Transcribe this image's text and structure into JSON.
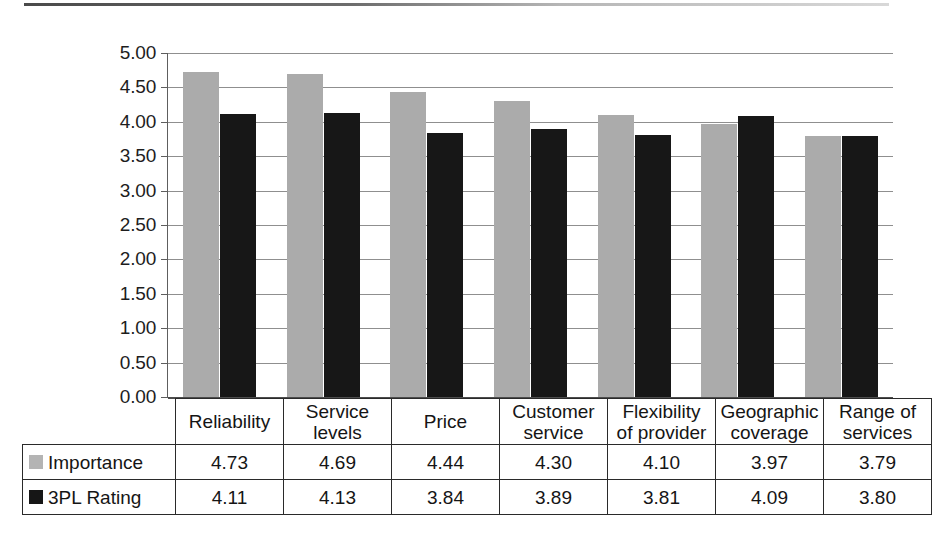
{
  "chart_data": {
    "type": "bar",
    "title": "",
    "subtitle": "",
    "xlabel": "",
    "ylabel": "",
    "ylim": [
      0,
      5
    ],
    "ytick_step": 0.5,
    "ytick_labels": [
      "5.00",
      "4.50",
      "4.00",
      "3.50",
      "3.00",
      "2.50",
      "2.00",
      "1.50",
      "1.00",
      "0.50",
      "0.00"
    ],
    "ytick_values": [
      5.0,
      4.5,
      4.0,
      3.5,
      3.0,
      2.5,
      2.0,
      1.5,
      1.0,
      0.5,
      0.0
    ],
    "grid": true,
    "legend_position": "table-left",
    "categories": [
      "Reliability",
      "Service levels",
      "Price",
      "Customer service",
      "Flexibility of provider",
      "Geographic coverage",
      "Range of services"
    ],
    "category_lines": [
      [
        "Reliability"
      ],
      [
        "Service",
        "levels"
      ],
      [
        "Price"
      ],
      [
        "Customer",
        "service"
      ],
      [
        "Flexibility",
        "of provider"
      ],
      [
        "Geographic",
        "coverage"
      ],
      [
        "Range of",
        "services"
      ]
    ],
    "series": [
      {
        "name": "Importance",
        "color": "#ababab",
        "values": [
          4.73,
          4.69,
          4.44,
          4.3,
          4.1,
          3.97,
          3.79
        ],
        "labels": [
          "4.73",
          "4.69",
          "4.44",
          "4.30",
          "4.10",
          "3.97",
          "3.79"
        ]
      },
      {
        "name": "3PL Rating",
        "color": "#171717",
        "values": [
          4.11,
          4.13,
          3.84,
          3.89,
          3.81,
          4.09,
          3.8
        ],
        "labels": [
          "4.11",
          "4.13",
          "3.84",
          "3.89",
          "3.81",
          "4.09",
          "3.80"
        ]
      }
    ]
  },
  "table": {
    "corner_label": "",
    "column_headers": [
      "Reliability",
      "Service levels",
      "Price",
      "Customer service",
      "Flexibility of provider",
      "Geographic coverage",
      "Range of services"
    ],
    "rows": [
      {
        "label": "Importance",
        "swatch_color": "#b4b4b4",
        "values": [
          "4.73",
          "4.69",
          "4.44",
          "4.30",
          "4.10",
          "3.97",
          "3.79"
        ]
      },
      {
        "label": "3PL Rating",
        "swatch_color": "#161616",
        "values": [
          "4.11",
          "4.13",
          "3.84",
          "3.89",
          "3.81",
          "4.09",
          "3.80"
        ]
      }
    ]
  },
  "colors": {
    "importance": "#ababab",
    "rating": "#171717",
    "gridline": "#8f8f8f",
    "axis": "#5e5e5e",
    "table_border": "#2a2a2a",
    "text": "#1a1a1a",
    "background": "#ffffff"
  }
}
